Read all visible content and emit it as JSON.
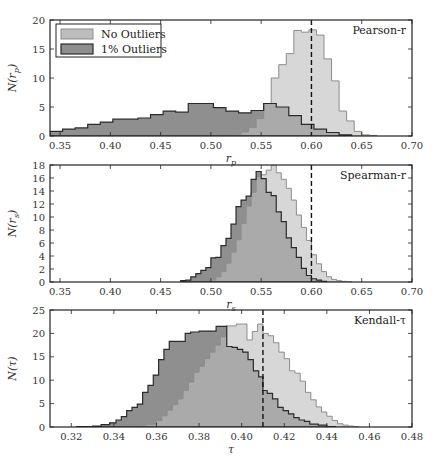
{
  "colors": {
    "no_outliers_fill": "#bdbdbd",
    "no_outliers_edge": "#8c8c8c",
    "outliers_fill": "#8f8f8f",
    "outliers_edge": "#2b2b2b",
    "axis": "#222222",
    "dashed": "#111111"
  },
  "legend": {
    "items": [
      {
        "label": "No Outliers",
        "key": "no_outliers"
      },
      {
        "label": "1% Outliers",
        "key": "outliers"
      }
    ]
  },
  "chart_data": [
    {
      "type": "bar",
      "panel": "top",
      "title": "Pearson-r",
      "xlabel": "r_p",
      "ylabel": "N(r_p)",
      "xlim": [
        0.34,
        0.7
      ],
      "ylim": [
        0,
        20
      ],
      "xticks": [
        "0.35",
        "0.40",
        "0.45",
        "0.50",
        "0.55",
        "0.60",
        "0.65",
        "0.70"
      ],
      "xtick_values": [
        0.35,
        0.4,
        0.45,
        0.5,
        0.55,
        0.6,
        0.65,
        0.7
      ],
      "yticks": [
        "0",
        "5",
        "10",
        "15",
        "20"
      ],
      "ytick_values": [
        0,
        5,
        10,
        15,
        20
      ],
      "true_value": 0.6,
      "series": [
        {
          "name": "1% Outliers",
          "key": "outliers",
          "bin_edges": [
            0.34,
            0.3525,
            0.365,
            0.3775,
            0.39,
            0.4025,
            0.415,
            0.4275,
            0.44,
            0.4525,
            0.465,
            0.4775,
            0.49,
            0.5025,
            0.515,
            0.5275,
            0.54,
            0.5525,
            0.565,
            0.5775,
            0.59,
            0.6025,
            0.615,
            0.6275,
            0.64
          ],
          "counts": [
            0.8,
            1.2,
            1.4,
            2.0,
            2.4,
            2.9,
            2.9,
            3.1,
            3.7,
            4.3,
            4.1,
            5.6,
            5.6,
            4.9,
            4.3,
            4.0,
            4.4,
            5.6,
            5.0,
            3.5,
            2.0,
            1.2,
            0.6,
            0.2
          ]
        },
        {
          "name": "No Outliers",
          "key": "no_outliers",
          "bin_edges": [
            0.515,
            0.5225,
            0.53,
            0.5375,
            0.545,
            0.5525,
            0.56,
            0.5675,
            0.575,
            0.5825,
            0.59,
            0.5975,
            0.605,
            0.6125,
            0.62,
            0.6275,
            0.635,
            0.6425,
            0.65,
            0.6575,
            0.665
          ],
          "counts": [
            0.1,
            0.3,
            0.7,
            1.5,
            3.0,
            5.6,
            10.0,
            12.3,
            14.2,
            18.2,
            17.9,
            18.3,
            17.4,
            13.3,
            9.5,
            4.3,
            2.6,
            0.8,
            0.2,
            0.1
          ]
        }
      ]
    },
    {
      "type": "bar",
      "panel": "middle",
      "title": "Spearman-r",
      "xlabel": "r_s",
      "ylabel": "N(r_s)",
      "xlim": [
        0.34,
        0.7
      ],
      "ylim": [
        0,
        18
      ],
      "xticks": [
        "0.35",
        "0.40",
        "0.45",
        "0.50",
        "0.55",
        "0.60",
        "0.65",
        "0.70"
      ],
      "xtick_values": [
        0.35,
        0.4,
        0.45,
        0.5,
        0.55,
        0.6,
        0.65,
        0.7
      ],
      "yticks": [
        "0",
        "2",
        "4",
        "6",
        "8",
        "10",
        "12",
        "14",
        "16",
        "18"
      ],
      "ytick_values": [
        0,
        2,
        4,
        6,
        8,
        10,
        12,
        14,
        16,
        18
      ],
      "true_value": 0.6,
      "series": [
        {
          "name": "1% Outliers",
          "key": "outliers",
          "bin_edges": [
            0.47,
            0.475,
            0.48,
            0.485,
            0.49,
            0.495,
            0.5,
            0.505,
            0.51,
            0.515,
            0.52,
            0.525,
            0.53,
            0.535,
            0.54,
            0.545,
            0.55,
            0.555,
            0.56,
            0.565,
            0.57,
            0.575,
            0.58,
            0.585,
            0.59,
            0.595,
            0.6,
            0.605,
            0.61,
            0.615
          ],
          "counts": [
            0.2,
            0.3,
            0.8,
            1.3,
            1.8,
            2.2,
            3.7,
            3.8,
            5.6,
            6.7,
            8.9,
            11.6,
            12.6,
            13.2,
            15.8,
            17.0,
            15.9,
            13.8,
            13.3,
            10.8,
            9.3,
            6.8,
            5.3,
            3.8,
            2.1,
            1.0,
            0.5,
            0.3,
            0.1
          ]
        },
        {
          "name": "No Outliers",
          "key": "no_outliers",
          "bin_edges": [
            0.5,
            0.505,
            0.51,
            0.515,
            0.52,
            0.525,
            0.53,
            0.535,
            0.54,
            0.545,
            0.55,
            0.555,
            0.56,
            0.565,
            0.57,
            0.575,
            0.58,
            0.585,
            0.59,
            0.595,
            0.6,
            0.605,
            0.61,
            0.615,
            0.62,
            0.625,
            0.63,
            0.635,
            0.64
          ],
          "counts": [
            0.3,
            0.8,
            1.6,
            2.9,
            4.6,
            6.5,
            9.0,
            11.7,
            13.8,
            16.2,
            16.5,
            17.2,
            18.0,
            16.8,
            15.8,
            14.4,
            12.6,
            10.3,
            8.4,
            6.4,
            4.2,
            2.8,
            1.6,
            0.8,
            0.4,
            0.2,
            0.1,
            0.05
          ]
        }
      ]
    },
    {
      "type": "bar",
      "panel": "bottom",
      "title": "Kendall-τ",
      "xlabel": "τ",
      "ylabel": "N(τ)",
      "xlim": [
        0.31,
        0.48
      ],
      "ylim": [
        0,
        25
      ],
      "xticks": [
        "0.32",
        "0.34",
        "0.36",
        "0.38",
        "0.40",
        "0.42",
        "0.44",
        "0.46",
        "0.48"
      ],
      "xtick_values": [
        0.32,
        0.34,
        0.36,
        0.38,
        0.4,
        0.42,
        0.44,
        0.46,
        0.48
      ],
      "yticks": [
        "0",
        "5",
        "10",
        "15",
        "20",
        "25"
      ],
      "ytick_values": [
        0,
        5,
        10,
        15,
        20,
        25
      ],
      "true_value": 0.41,
      "series": [
        {
          "name": "1% Outliers",
          "key": "outliers",
          "bin_edges": [
            0.3225,
            0.33,
            0.334,
            0.338,
            0.341,
            0.3435,
            0.346,
            0.3485,
            0.351,
            0.3535,
            0.356,
            0.3585,
            0.361,
            0.3635,
            0.366,
            0.3685,
            0.371,
            0.3735,
            0.376,
            0.38,
            0.384,
            0.388,
            0.3905,
            0.393,
            0.3955,
            0.398,
            0.4005,
            0.403,
            0.4055,
            0.408,
            0.41,
            0.412,
            0.4145,
            0.417,
            0.4195,
            0.422,
            0.4245,
            0.427,
            0.4295,
            0.432,
            0.436,
            0.44,
            0.444
          ],
          "counts": [
            0.1,
            0.2,
            0.5,
            0.9,
            1.5,
            2.2,
            3.5,
            4.2,
            4.9,
            7.4,
            8.9,
            11.1,
            14.4,
            16.6,
            18.3,
            18.3,
            18.3,
            20.0,
            20.3,
            20.5,
            20.5,
            21.5,
            21.5,
            17.2,
            17.0,
            16.6,
            16.0,
            14.4,
            12.0,
            10.7,
            7.8,
            7.2,
            6.0,
            4.2,
            3.5,
            2.8,
            2.0,
            1.5,
            1.2,
            0.6,
            0.4,
            0.1
          ]
        },
        {
          "name": "No Outliers",
          "key": "no_outliers",
          "bin_edges": [
            0.35,
            0.355,
            0.36,
            0.3625,
            0.365,
            0.3675,
            0.37,
            0.3725,
            0.375,
            0.3775,
            0.38,
            0.3825,
            0.385,
            0.3875,
            0.39,
            0.3925,
            0.395,
            0.3975,
            0.4,
            0.4025,
            0.405,
            0.4075,
            0.41,
            0.4125,
            0.415,
            0.4175,
            0.42,
            0.4225,
            0.425,
            0.4275,
            0.43,
            0.4325,
            0.435,
            0.4375,
            0.44,
            0.4425,
            0.445,
            0.4475,
            0.45,
            0.4525,
            0.455
          ],
          "counts": [
            0.3,
            0.6,
            1.4,
            2.4,
            3.6,
            4.8,
            6.0,
            7.8,
            9.6,
            11.7,
            13.0,
            14.6,
            16.0,
            17.5,
            19.3,
            21.6,
            21.6,
            22.0,
            22.0,
            18.6,
            20.4,
            22.0,
            20.0,
            19.5,
            18.0,
            16.0,
            14.6,
            12.0,
            11.5,
            9.8,
            7.4,
            5.8,
            4.3,
            3.2,
            2.3,
            1.4,
            0.7,
            0.4,
            0.2,
            0.1
          ]
        }
      ]
    }
  ]
}
